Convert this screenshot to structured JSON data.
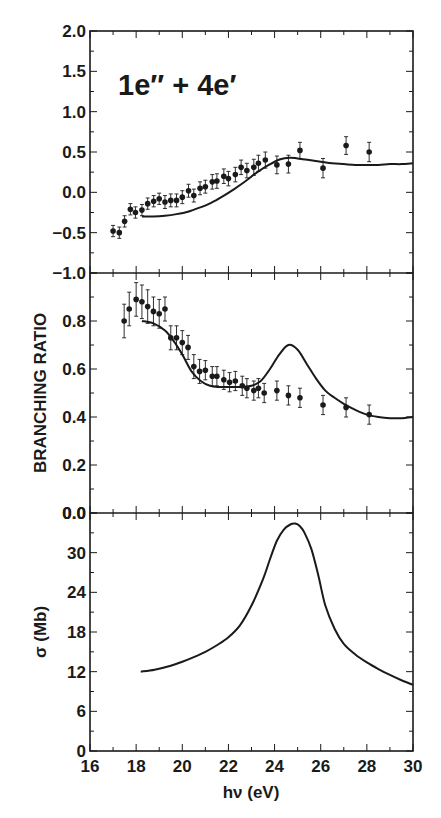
{
  "colors": {
    "ink": "#1a1a1a",
    "background": "#ffffff"
  },
  "figure": {
    "ylabel_shared": "BRANCHING RATIO",
    "xlabel": "hν (eV)"
  },
  "chart_data": [
    {
      "type": "scatter",
      "panel": "top",
      "annotation": "1e″ + 4e′",
      "title": "",
      "xlabel": "hν (eV)",
      "ylabel": "",
      "xlim": [
        16,
        30
      ],
      "ylim": [
        -1.0,
        2.0
      ],
      "yticks": [
        "2.0",
        "1.5",
        "1.0",
        "0.5",
        "0.0",
        "−0.5",
        "−1.0"
      ],
      "ytick_values": [
        2.0,
        1.5,
        1.0,
        0.5,
        0.0,
        -0.5,
        -1.0
      ],
      "grid": false,
      "series": [
        {
          "name": "experiment",
          "style": "points-with-error-bars",
          "x": [
            17.0,
            17.27,
            17.5,
            17.75,
            17.97,
            18.25,
            18.5,
            18.76,
            19.0,
            19.25,
            19.5,
            19.75,
            20.0,
            20.27,
            20.5,
            20.77,
            21.0,
            21.3,
            21.5,
            21.8,
            22.0,
            22.3,
            22.55,
            22.8,
            23.1,
            23.3,
            23.6,
            24.1,
            24.6,
            25.1,
            26.1,
            27.1,
            28.1
          ],
          "y": [
            -0.48,
            -0.5,
            -0.36,
            -0.21,
            -0.25,
            -0.22,
            -0.14,
            -0.11,
            -0.08,
            -0.12,
            -0.1,
            -0.1,
            -0.06,
            0.02,
            -0.04,
            0.05,
            0.07,
            0.13,
            0.14,
            0.2,
            0.17,
            0.22,
            0.31,
            0.27,
            0.31,
            0.36,
            0.4,
            0.34,
            0.35,
            0.52,
            0.3,
            0.58,
            0.5
          ],
          "yerr": [
            0.07,
            0.07,
            0.07,
            0.07,
            0.07,
            0.07,
            0.07,
            0.07,
            0.07,
            0.08,
            0.08,
            0.08,
            0.08,
            0.08,
            0.08,
            0.08,
            0.08,
            0.09,
            0.09,
            0.09,
            0.09,
            0.09,
            0.09,
            0.09,
            0.1,
            0.1,
            0.1,
            0.11,
            0.11,
            0.1,
            0.12,
            0.11,
            0.12
          ]
        },
        {
          "name": "theory",
          "style": "line",
          "x": [
            18.25,
            18.75,
            19.25,
            19.75,
            20.25,
            20.75,
            21.25,
            21.75,
            22.25,
            22.75,
            23.25,
            23.75,
            24.25,
            24.65,
            25.0,
            25.5,
            26.0,
            26.5,
            27.0,
            27.5,
            28.0,
            28.5,
            29.0,
            29.5,
            30.0
          ],
          "y": [
            -0.3,
            -0.3,
            -0.29,
            -0.27,
            -0.24,
            -0.19,
            -0.13,
            -0.05,
            0.04,
            0.14,
            0.25,
            0.34,
            0.41,
            0.43,
            0.42,
            0.4,
            0.38,
            0.36,
            0.35,
            0.34,
            0.34,
            0.34,
            0.35,
            0.35,
            0.36
          ]
        }
      ]
    },
    {
      "type": "scatter",
      "panel": "middle",
      "title": "",
      "xlabel": "hν (eV)",
      "ylabel": "BRANCHING RATIO",
      "xlim": [
        16,
        30
      ],
      "ylim": [
        0.0,
        1.0
      ],
      "yticks": [
        "0.8",
        "0.6",
        "0.4",
        "0.2",
        "0.0"
      ],
      "ytick_values": [
        0.8,
        0.6,
        0.4,
        0.2,
        0.0
      ],
      "grid": false,
      "series": [
        {
          "name": "experiment",
          "style": "points-with-error-bars",
          "x": [
            17.48,
            17.7,
            18.0,
            18.25,
            18.5,
            18.75,
            19.0,
            19.25,
            19.5,
            19.75,
            20.0,
            20.25,
            20.5,
            20.75,
            21.0,
            21.3,
            21.5,
            21.8,
            22.05,
            22.3,
            22.6,
            22.8,
            23.1,
            23.3,
            23.55,
            24.1,
            24.6,
            25.1,
            26.1,
            27.1,
            28.1
          ],
          "y": [
            0.8,
            0.85,
            0.89,
            0.88,
            0.86,
            0.84,
            0.83,
            0.85,
            0.73,
            0.73,
            0.71,
            0.69,
            0.61,
            0.59,
            0.595,
            0.57,
            0.57,
            0.555,
            0.545,
            0.55,
            0.53,
            0.52,
            0.51,
            0.52,
            0.5,
            0.51,
            0.49,
            0.48,
            0.45,
            0.44,
            0.41
          ],
          "yerr": [
            0.07,
            0.07,
            0.07,
            0.07,
            0.07,
            0.06,
            0.06,
            0.05,
            0.05,
            0.05,
            0.05,
            0.05,
            0.05,
            0.05,
            0.04,
            0.04,
            0.04,
            0.04,
            0.04,
            0.04,
            0.04,
            0.04,
            0.04,
            0.04,
            0.04,
            0.04,
            0.04,
            0.04,
            0.04,
            0.04,
            0.04
          ]
        },
        {
          "name": "theory",
          "style": "line",
          "x": [
            18.25,
            18.75,
            19.25,
            19.6,
            20.0,
            20.4,
            20.8,
            21.2,
            21.6,
            22.0,
            22.5,
            23.0,
            23.4,
            23.8,
            24.2,
            24.6,
            25.0,
            25.4,
            25.8,
            26.2,
            26.6,
            27.0,
            27.5,
            28.0,
            28.5,
            29.0,
            29.5,
            30.0
          ],
          "y": [
            0.8,
            0.79,
            0.76,
            0.72,
            0.66,
            0.59,
            0.55,
            0.53,
            0.525,
            0.525,
            0.525,
            0.53,
            0.55,
            0.6,
            0.66,
            0.7,
            0.68,
            0.62,
            0.56,
            0.51,
            0.48,
            0.455,
            0.43,
            0.41,
            0.4,
            0.395,
            0.395,
            0.4
          ]
        }
      ]
    },
    {
      "type": "line",
      "panel": "bottom",
      "title": "",
      "xlabel": "hν (eV)",
      "ylabel": "σ (Mb)",
      "xlim": [
        16,
        30
      ],
      "ylim": [
        0,
        36
      ],
      "xticks": [
        "16",
        "18",
        "20",
        "22",
        "24",
        "26",
        "28",
        "30"
      ],
      "xtick_values": [
        16,
        18,
        20,
        22,
        24,
        26,
        28,
        30
      ],
      "yticks": [
        "30",
        "24",
        "18",
        "12",
        "6",
        "0"
      ],
      "ytick_values": [
        30,
        24,
        18,
        12,
        6,
        0
      ],
      "top_tick_label": "0.0",
      "grid": false,
      "series": [
        {
          "name": "cross section",
          "style": "line",
          "x": [
            18.2,
            18.8,
            19.5,
            20.0,
            20.5,
            21.0,
            21.5,
            22.0,
            22.5,
            23.0,
            23.5,
            23.8,
            24.1,
            24.4,
            24.7,
            24.9,
            25.1,
            25.3,
            25.6,
            25.9,
            26.2,
            26.6,
            27.0,
            27.5,
            28.0,
            28.5,
            29.0,
            29.5,
            30.0
          ],
          "y": [
            12.0,
            12.3,
            12.9,
            13.5,
            14.2,
            15.0,
            16.0,
            17.2,
            19.0,
            22.0,
            26.0,
            29.0,
            31.8,
            33.5,
            34.3,
            34.4,
            34.0,
            33.0,
            30.5,
            26.5,
            22.0,
            18.5,
            16.2,
            14.6,
            13.4,
            12.4,
            11.5,
            10.7,
            10.0
          ]
        }
      ]
    }
  ]
}
